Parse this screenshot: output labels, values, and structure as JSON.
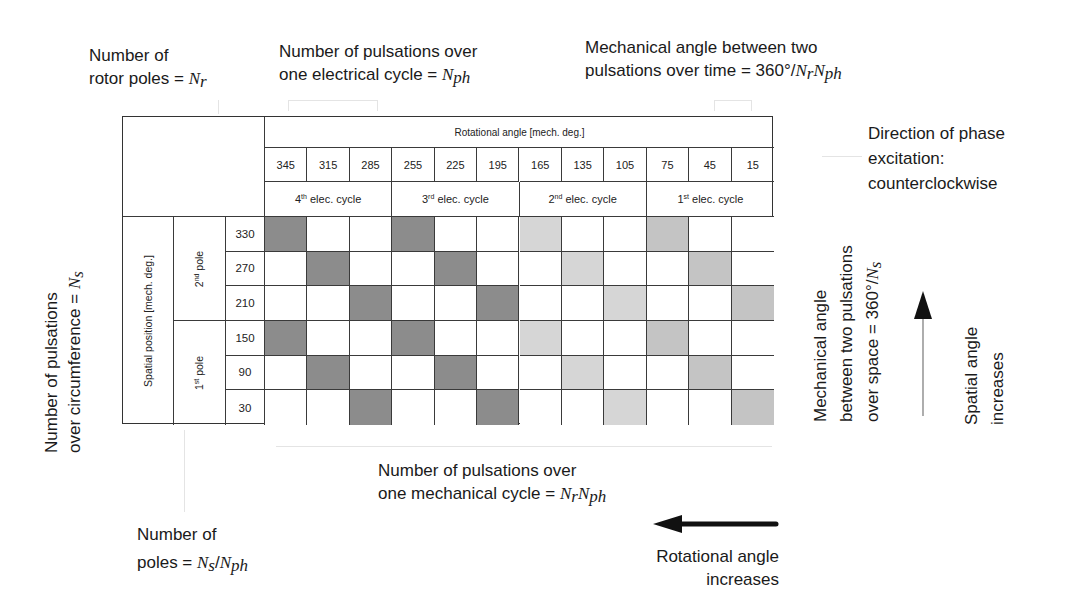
{
  "annotations": {
    "rotor_poles": {
      "line1": "Number of",
      "line2_prefix": "rotor poles = ",
      "symbol": "N",
      "sub": "r"
    },
    "pulsations_elec": {
      "line1": "Number of pulsations over",
      "line2_prefix": "one electrical cycle = ",
      "symbol": "N",
      "sub": "ph"
    },
    "mech_angle_time": {
      "line1": "Mechanical angle between two",
      "line2_prefix": "pulsations over time = 360°/",
      "symbol1": "N",
      "sub1": "r",
      "symbol2": "N",
      "sub2": "ph"
    },
    "phase_direction": {
      "line1": "Direction of phase",
      "line2": "excitation:",
      "line3": "counterclockwise"
    },
    "pulsations_circ": {
      "line1": "Number of pulsations",
      "line2_prefix": "over circumference = ",
      "symbol": "N",
      "sub": "s"
    },
    "mech_angle_space": {
      "line1": "Mechanical angle",
      "line2": "between two pulsations",
      "line3_prefix": "over space = 360°/",
      "symbol": "N",
      "sub": "s"
    },
    "spatial_increases": {
      "line1": "Spatial angle",
      "line2": "increases"
    },
    "pulsations_mech": {
      "line1": "Number of pulsations over",
      "line2_prefix": "one mechanical cycle = ",
      "symbol1": "N",
      "sub1": "r",
      "symbol2": "N",
      "sub2": "ph"
    },
    "poles": {
      "line1": "Number of",
      "line2_prefix": "poles = ",
      "symbol1": "N",
      "sub1": "s",
      "symbol2": "N",
      "sub2": "ph"
    },
    "rotational_increases": {
      "line1": "Rotational angle",
      "line2": "increases"
    }
  },
  "table": {
    "rot_header": "Rotational angle [mech. deg.]",
    "rot_angles": [
      "345",
      "315",
      "285",
      "255",
      "225",
      "195",
      "165",
      "135",
      "105",
      "75",
      "45",
      "15"
    ],
    "cycles": [
      {
        "num": "4",
        "sup": "th",
        "label": " elec. cycle"
      },
      {
        "num": "3",
        "sup": "rd",
        "label": " elec. cycle"
      },
      {
        "num": "2",
        "sup": "nd",
        "label": " elec. cycle"
      },
      {
        "num": "1",
        "sup": "st",
        "label": " elec. cycle"
      }
    ],
    "spatial_header": "Spatial position [mech. deg.]",
    "poles": [
      {
        "num": "2",
        "sup": "nd",
        "label": " pole"
      },
      {
        "num": "1",
        "sup": "st",
        "label": " pole"
      }
    ],
    "spatial_angles": [
      "330",
      "270",
      "210",
      "150",
      "90",
      "30"
    ],
    "colors": {
      "dark": "#8c8c8c",
      "medium": "#c4c4c4",
      "light": "#d6d6d6",
      "empty": "#ffffff",
      "line": "#3a3a3a"
    },
    "shading": [
      [
        "dark",
        "empty",
        "empty",
        "dark",
        "empty",
        "empty",
        "light",
        "empty",
        "empty",
        "medium",
        "empty",
        "empty"
      ],
      [
        "empty",
        "dark",
        "empty",
        "empty",
        "dark",
        "empty",
        "empty",
        "light",
        "empty",
        "empty",
        "medium",
        "empty"
      ],
      [
        "empty",
        "empty",
        "dark",
        "empty",
        "empty",
        "dark",
        "empty",
        "empty",
        "light",
        "empty",
        "empty",
        "medium"
      ],
      [
        "dark",
        "empty",
        "empty",
        "dark",
        "empty",
        "empty",
        "light",
        "empty",
        "empty",
        "medium",
        "empty",
        "empty"
      ],
      [
        "empty",
        "dark",
        "empty",
        "empty",
        "dark",
        "empty",
        "empty",
        "light",
        "empty",
        "empty",
        "medium",
        "empty"
      ],
      [
        "empty",
        "empty",
        "dark",
        "empty",
        "empty",
        "dark",
        "empty",
        "empty",
        "light",
        "empty",
        "empty",
        "medium"
      ]
    ]
  }
}
